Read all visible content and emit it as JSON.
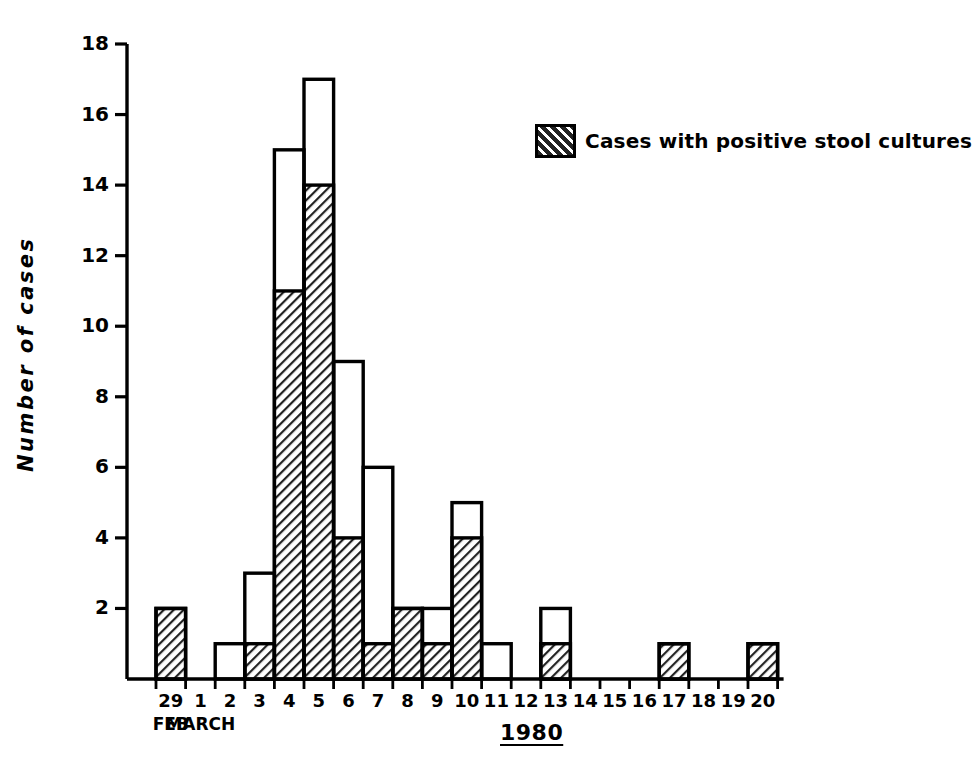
{
  "chart_data": {
    "type": "bar",
    "title": "",
    "xlabel": "1980",
    "ylabel": "Number of cases",
    "ylim": [
      0,
      18
    ],
    "ytick_labels": [
      "18",
      "16",
      "14",
      "12",
      "10",
      "8",
      "6",
      "4",
      "2"
    ],
    "ytick_values": [
      18,
      16,
      14,
      12,
      10,
      8,
      6,
      4,
      2
    ],
    "grid": false,
    "legend_position": "top-right",
    "legend": [
      {
        "label": "Cases with positive stool cultures",
        "fill": "hatched",
        "color": "#1a1a1a"
      }
    ],
    "categories": [
      "29",
      "1",
      "2",
      "3",
      "4",
      "5",
      "6",
      "7",
      "8",
      "9",
      "10",
      "11",
      "12",
      "13",
      "14",
      "15",
      "16",
      "17",
      "18",
      "19",
      "20"
    ],
    "category_sublabels": [
      "FEB",
      "MARCH",
      "",
      "",
      "",
      "",
      "",
      "",
      "",
      "",
      "",
      "",
      "",
      "",
      "",
      "",
      "",
      "",
      "",
      "",
      ""
    ],
    "series": [
      {
        "name": "Total cases",
        "style": "outline",
        "values": [
          2,
          0,
          1,
          3,
          15,
          17,
          9,
          6,
          2,
          2,
          5,
          1,
          0,
          2,
          0,
          0,
          0,
          1,
          0,
          0,
          1
        ]
      },
      {
        "name": "Cases with positive stool cultures",
        "style": "hatched",
        "values": [
          2,
          0,
          0,
          1,
          11,
          14,
          4,
          1,
          2,
          1,
          4,
          0,
          0,
          1,
          0,
          0,
          0,
          1,
          0,
          0,
          1
        ]
      }
    ]
  },
  "axis": {
    "x_title": "1980",
    "y_title": "Number of cases"
  },
  "legend": {
    "item_label": "Cases with positive stool cultures"
  },
  "colors": {
    "ink": "#000000",
    "background": "#ffffff",
    "hatch": "#2b2b2b"
  }
}
